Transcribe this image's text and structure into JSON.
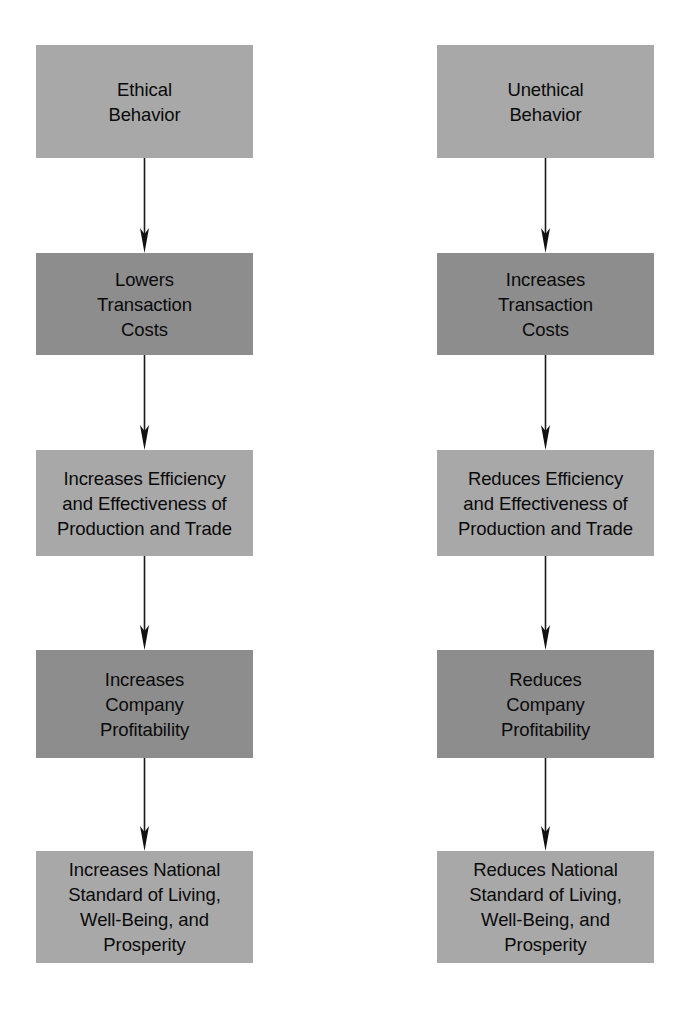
{
  "diagram": {
    "type": "two-column-vertical-flowchart",
    "colors": {
      "background": "#ffffff",
      "node_light": "#a8a8a8",
      "node_dark": "#8d8d8d",
      "text": "#0a0a0a",
      "arrow": "#1a1a1a"
    },
    "columns": [
      {
        "id": "ethical-chain",
        "name": "Ethical Behavior Chain",
        "nodes": [
          {
            "id": "ethical-behavior",
            "label": "Ethical\nBehavior",
            "shade": "light"
          },
          {
            "id": "lowers-transaction-costs",
            "label": "Lowers\nTransaction\nCosts",
            "shade": "dark"
          },
          {
            "id": "increases-efficiency",
            "label": "Increases Efficiency\nand Effectiveness of\nProduction and Trade",
            "shade": "light"
          },
          {
            "id": "increases-profitability",
            "label": "Increases\nCompany\nProfitability",
            "shade": "dark"
          },
          {
            "id": "increases-standard-living",
            "label": "Increases National\nStandard of Living,\nWell-Being, and\nProsperity",
            "shade": "light"
          }
        ],
        "arrows": [
          {
            "id": "arrow-ethical-1",
            "from": "ethical-behavior",
            "to": "lowers-transaction-costs"
          },
          {
            "id": "arrow-ethical-2",
            "from": "lowers-transaction-costs",
            "to": "increases-efficiency"
          },
          {
            "id": "arrow-ethical-3",
            "from": "increases-efficiency",
            "to": "increases-profitability"
          },
          {
            "id": "arrow-ethical-4",
            "from": "increases-profitability",
            "to": "increases-standard-living"
          }
        ]
      },
      {
        "id": "unethical-chain",
        "name": "Unethical Behavior Chain",
        "nodes": [
          {
            "id": "unethical-behavior",
            "label": "Unethical\nBehavior",
            "shade": "light"
          },
          {
            "id": "increases-transaction-costs",
            "label": "Increases\nTransaction\nCosts",
            "shade": "dark"
          },
          {
            "id": "reduces-efficiency",
            "label": "Reduces Efficiency\nand Effectiveness of\nProduction and Trade",
            "shade": "light"
          },
          {
            "id": "reduces-profitability",
            "label": "Reduces\nCompany\nProfitability",
            "shade": "dark"
          },
          {
            "id": "reduces-standard-living",
            "label": "Reduces National\nStandard of Living,\nWell-Being, and\nProsperity",
            "shade": "light"
          }
        ],
        "arrows": [
          {
            "id": "arrow-unethical-1",
            "from": "unethical-behavior",
            "to": "increases-transaction-costs"
          },
          {
            "id": "arrow-unethical-2",
            "from": "increases-transaction-costs",
            "to": "reduces-efficiency"
          },
          {
            "id": "arrow-unethical-3",
            "from": "reduces-efficiency",
            "to": "reduces-profitability"
          },
          {
            "id": "arrow-unethical-4",
            "from": "reduces-profitability",
            "to": "reduces-standard-living"
          }
        ]
      }
    ]
  }
}
